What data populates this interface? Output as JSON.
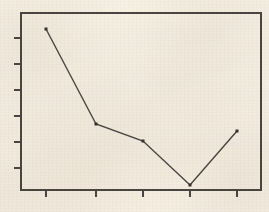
{
  "figure": {
    "kind": "scanned-line-chart",
    "background_color": "#f8f3ea",
    "ink_color": "#4a4440",
    "has_title": false,
    "has_axis_labels": false,
    "has_tick_labels": false,
    "has_legend": false,
    "has_gridlines": false
  },
  "plot_frame": {
    "left": 21,
    "right": 261,
    "top": 13,
    "bottom": 190,
    "border_width": 2,
    "border_color": "#4a4440"
  },
  "axes": {
    "x_axis": {
      "tick_direction": "out",
      "tick_length": 7,
      "tick_pixel_positions": [
        46,
        96,
        143,
        190,
        237
      ],
      "tick_count": 5,
      "labels": []
    },
    "y_axis": {
      "tick_direction": "out",
      "tick_length": 7,
      "tick_pixel_positions": [
        38,
        64,
        90,
        116,
        142,
        168
      ],
      "tick_count": 6,
      "labels": []
    }
  },
  "series_style": {
    "line_color": "#4a4440",
    "line_width": 1.4,
    "marker": "square",
    "marker_size": 3,
    "marker_color": "#36312e"
  },
  "chart_data": {
    "type": "line",
    "title": "",
    "subtitle": "",
    "xlabel": "",
    "ylabel": "",
    "grid": false,
    "legend": null,
    "x": [
      1,
      2,
      3,
      4,
      5
    ],
    "categories": [
      "1",
      "2",
      "3",
      "4",
      "5"
    ],
    "xtick_labels": [],
    "ytick_labels": [],
    "xlim": [
      0.5,
      5.5
    ],
    "ylim": [
      0,
      100
    ],
    "values": [
      91,
      37,
      28,
      3,
      33
    ],
    "series": [
      {
        "name": "",
        "values": [
          91,
          37,
          28,
          3,
          33
        ],
        "pixel_points": [
          {
            "x": 46,
            "y": 29
          },
          {
            "x": 96,
            "y": 124
          },
          {
            "x": 143,
            "y": 141
          },
          {
            "x": 190,
            "y": 185
          },
          {
            "x": 237,
            "y": 131
          }
        ]
      }
    ],
    "annotations": []
  }
}
